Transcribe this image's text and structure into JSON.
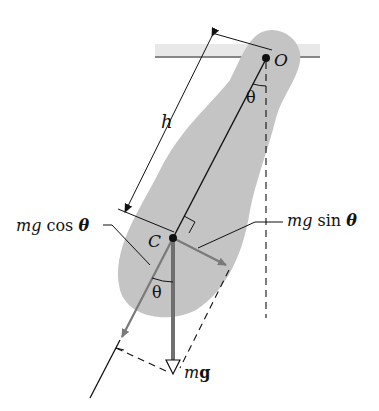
{
  "diagram": {
    "colors": {
      "body_fill": "#c4c4c4",
      "ceiling_fill": "#e8e8e8",
      "line": "#111111",
      "vector_gray": "#7a7a7a",
      "weight_vector": "#6f6f6f"
    },
    "labels": {
      "pivot": "O",
      "center_of_mass": "C",
      "distance": "h",
      "angle_top": "θ",
      "angle_bottom": "θ",
      "cos_component_mg": "mg",
      "cos_component_fn": " cos ",
      "cos_component_theta": "θ",
      "sin_component_mg": "mg",
      "sin_component_fn": " sin ",
      "sin_component_theta": "θ",
      "weight_m": "m",
      "weight_g": "g"
    }
  }
}
